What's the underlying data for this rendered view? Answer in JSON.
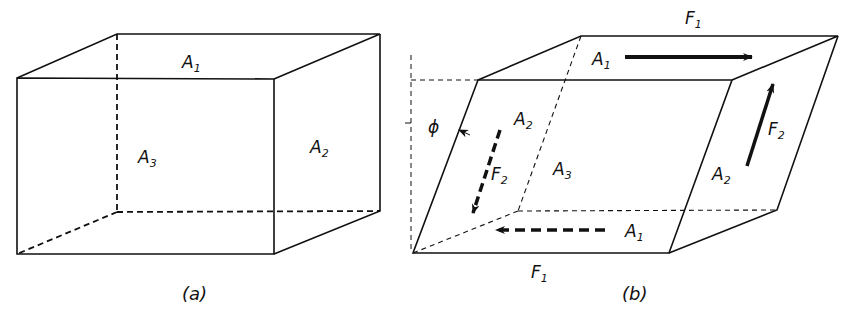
{
  "figure_a": {
    "caption": "(a)",
    "labels": {
      "top_face": {
        "main": "A",
        "sub": "1"
      },
      "back_face": {
        "main": "A",
        "sub": "3"
      },
      "side_face": {
        "main": "A",
        "sub": "2"
      }
    }
  },
  "figure_b": {
    "caption": "(b)",
    "angle_symbol": "ϕ",
    "labels": {
      "top_force": {
        "main": "F",
        "sub": "1"
      },
      "bottom_force": {
        "main": "F",
        "sub": "1"
      },
      "top_face": {
        "main": "A",
        "sub": "1"
      },
      "bottom_face": {
        "main": "A",
        "sub": "1"
      },
      "left_face": {
        "main": "A",
        "sub": "2"
      },
      "right_face": {
        "main": "A",
        "sub": "2"
      },
      "back_face": {
        "main": "A",
        "sub": "3"
      },
      "left_force": {
        "main": "F",
        "sub": "2"
      },
      "right_force": {
        "main": "F",
        "sub": "2"
      }
    }
  },
  "colors": {
    "line": "#111111",
    "background": "#ffffff"
  }
}
